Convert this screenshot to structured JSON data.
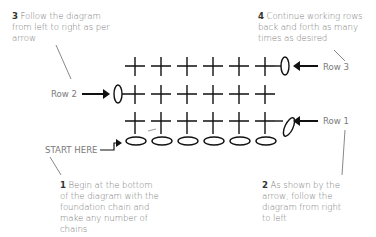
{
  "notes": [
    {
      "num": "3",
      "text": "Follow the diagram from left to right as per arrow"
    },
    {
      "num": "4",
      "text": "Continue working rows back and forth as many times as desired"
    },
    {
      "num": "1",
      "text": "Begin at the bottom of the diagram with the foundation chain and make any number of chains"
    },
    {
      "num": "2",
      "text": "As shown by the arrow, follow the diagram from right to left"
    }
  ],
  "labels": {
    "row1": "Row 1",
    "row2": "Row 2",
    "row3": "Row 3",
    "start": "START HERE"
  },
  "diagram": {
    "stitches_per_row": 6,
    "chain_count": 6,
    "rows": 3,
    "stroke_color": "#111111",
    "text_color": "#7a7a7a"
  }
}
